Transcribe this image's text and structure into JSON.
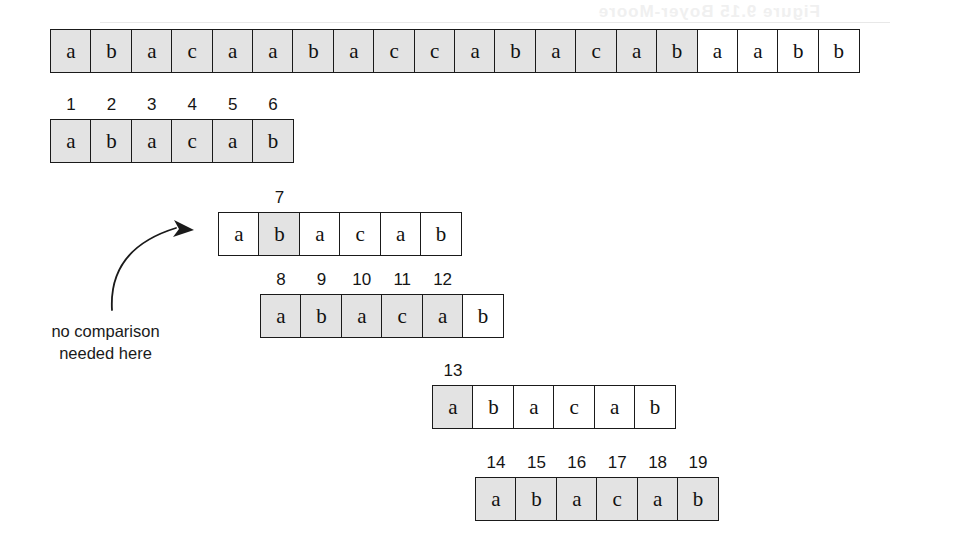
{
  "figure": {
    "kind": "string-matching-comparison-trace",
    "alphabet_note": "characters a, b, c",
    "bleed_text": "Figure 9.15 Boyer-Moore",
    "annotation": {
      "line1": "no comparison",
      "line2": "needed here"
    }
  },
  "colors": {
    "shaded_cell": "#e3e3e3",
    "white_cell": "#ffffff",
    "border": "#1a1a1a",
    "text": "#111111"
  },
  "rows": [
    {
      "name": "text-row",
      "x": 50,
      "y": 29,
      "cells": [
        {
          "ch": "a",
          "shaded": true,
          "idx": ""
        },
        {
          "ch": "b",
          "shaded": true,
          "idx": ""
        },
        {
          "ch": "a",
          "shaded": true,
          "idx": ""
        },
        {
          "ch": "c",
          "shaded": true,
          "idx": ""
        },
        {
          "ch": "a",
          "shaded": true,
          "idx": ""
        },
        {
          "ch": "a",
          "shaded": true,
          "idx": ""
        },
        {
          "ch": "b",
          "shaded": true,
          "idx": ""
        },
        {
          "ch": "a",
          "shaded": true,
          "idx": ""
        },
        {
          "ch": "c",
          "shaded": true,
          "idx": ""
        },
        {
          "ch": "c",
          "shaded": true,
          "idx": ""
        },
        {
          "ch": "a",
          "shaded": true,
          "idx": ""
        },
        {
          "ch": "b",
          "shaded": true,
          "idx": ""
        },
        {
          "ch": "a",
          "shaded": true,
          "idx": ""
        },
        {
          "ch": "c",
          "shaded": true,
          "idx": ""
        },
        {
          "ch": "a",
          "shaded": true,
          "idx": ""
        },
        {
          "ch": "b",
          "shaded": true,
          "idx": ""
        },
        {
          "ch": "a",
          "shaded": false,
          "idx": ""
        },
        {
          "ch": "a",
          "shaded": false,
          "idx": ""
        },
        {
          "ch": "b",
          "shaded": false,
          "idx": ""
        },
        {
          "ch": "b",
          "shaded": false,
          "idx": ""
        }
      ]
    },
    {
      "name": "pattern-pass-1",
      "x": 50,
      "y": 119,
      "cells": [
        {
          "ch": "a",
          "shaded": true,
          "idx": "1"
        },
        {
          "ch": "b",
          "shaded": true,
          "idx": "2"
        },
        {
          "ch": "a",
          "shaded": true,
          "idx": "3"
        },
        {
          "ch": "c",
          "shaded": true,
          "idx": "4"
        },
        {
          "ch": "a",
          "shaded": true,
          "idx": "5"
        },
        {
          "ch": "b",
          "shaded": true,
          "idx": "6"
        }
      ]
    },
    {
      "name": "pattern-pass-2",
      "x": 218,
      "y": 212,
      "cells": [
        {
          "ch": "a",
          "shaded": false,
          "idx": ""
        },
        {
          "ch": "b",
          "shaded": true,
          "idx": "7"
        },
        {
          "ch": "a",
          "shaded": false,
          "idx": ""
        },
        {
          "ch": "c",
          "shaded": false,
          "idx": ""
        },
        {
          "ch": "a",
          "shaded": false,
          "idx": ""
        },
        {
          "ch": "b",
          "shaded": false,
          "idx": ""
        }
      ]
    },
    {
      "name": "pattern-pass-3",
      "x": 260,
      "y": 294,
      "cells": [
        {
          "ch": "a",
          "shaded": true,
          "idx": "8"
        },
        {
          "ch": "b",
          "shaded": true,
          "idx": "9"
        },
        {
          "ch": "a",
          "shaded": true,
          "idx": "10"
        },
        {
          "ch": "c",
          "shaded": true,
          "idx": "11"
        },
        {
          "ch": "a",
          "shaded": true,
          "idx": "12"
        },
        {
          "ch": "b",
          "shaded": false,
          "idx": ""
        }
      ]
    },
    {
      "name": "pattern-pass-4",
      "x": 432,
      "y": 385,
      "cells": [
        {
          "ch": "a",
          "shaded": true,
          "idx": "13"
        },
        {
          "ch": "b",
          "shaded": false,
          "idx": ""
        },
        {
          "ch": "a",
          "shaded": false,
          "idx": ""
        },
        {
          "ch": "c",
          "shaded": false,
          "idx": ""
        },
        {
          "ch": "a",
          "shaded": false,
          "idx": ""
        },
        {
          "ch": "b",
          "shaded": false,
          "idx": ""
        }
      ]
    },
    {
      "name": "pattern-pass-5",
      "x": 475,
      "y": 477,
      "cells": [
        {
          "ch": "a",
          "shaded": true,
          "idx": "14"
        },
        {
          "ch": "b",
          "shaded": true,
          "idx": "15"
        },
        {
          "ch": "a",
          "shaded": true,
          "idx": "16"
        },
        {
          "ch": "c",
          "shaded": true,
          "idx": "17"
        },
        {
          "ch": "a",
          "shaded": true,
          "idx": "18"
        },
        {
          "ch": "b",
          "shaded": true,
          "idx": "19"
        }
      ]
    }
  ]
}
